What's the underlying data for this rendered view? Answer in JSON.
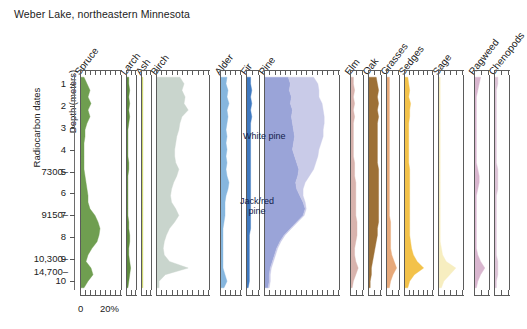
{
  "title": "Weber Lake, northeastern Minnesota",
  "axes": {
    "depth_axis_label": "Depth (meters)",
    "depth_ticks": [
      "1",
      "2",
      "3",
      "4",
      "5",
      "6",
      "7",
      "8",
      "9",
      "10"
    ],
    "radiocarbon_axis_label": "Radiocarbon dates",
    "x_axis_labels": {
      "zero": "0",
      "twenty": "20%"
    }
  },
  "radiocarbon_dates": [
    {
      "label": "7300–",
      "depth": 5.0
    },
    {
      "label": "9150–",
      "depth": 7.0
    },
    {
      "label": "10,300–",
      "depth": 9.0
    },
    {
      "label": "14,700–",
      "depth": 9.6
    }
  ],
  "annotations": [
    {
      "name": "white-pine-label",
      "text": "White pine",
      "x": 243,
      "y": 131
    },
    {
      "name": "jack-red-pine-label",
      "text": "Jack/red\npine",
      "x": 240,
      "y": 196
    }
  ],
  "colors": {
    "spruce": "#6f9e50",
    "larch": "#5d8a3e",
    "ash": "#cdd66a",
    "birch": "#c9d5cd",
    "alder": "#86b6de",
    "fir": "#3f79c0",
    "jack_red_pine": "#9aa4d8",
    "white_pine": "#c9cbe8",
    "elm": "#d8b3ad",
    "oak": "#9d7036",
    "grasses": "#e7a97a",
    "sedges": "#f3c24a",
    "sage": "#f7eec0",
    "ragweed": "#d9b6cf",
    "chenopods": "#dcc3d6",
    "frame": "#5b5b5b"
  },
  "chart_data": {
    "type": "area",
    "orientation": "vertical-stratigraphic",
    "title": "Weber Lake, northeastern Minnesota",
    "xlabel": "Pollen percentage",
    "ylabel": "Depth (meters)",
    "ylim": [
      0.6,
      10.4
    ],
    "xlim": [
      0,
      40
    ],
    "x_tick_interval": 5,
    "grid": false,
    "legend": "in-panel annotations",
    "depths": [
      0.7,
      1.0,
      1.3,
      1.6,
      1.9,
      2.2,
      2.5,
      2.8,
      3.1,
      3.4,
      3.7,
      4.0,
      4.3,
      4.6,
      4.9,
      5.2,
      5.5,
      5.8,
      6.1,
      6.4,
      6.7,
      7.0,
      7.3,
      7.6,
      7.9,
      8.2,
      8.5,
      8.8,
      9.1,
      9.4,
      9.7,
      10.0,
      10.3
    ],
    "panels": [
      {
        "name": "spruce",
        "label": "Spruce",
        "width_units": 42,
        "max_percent": 40,
        "series": [
          {
            "name": "Spruce",
            "color": "#6f9e50",
            "values": [
              3,
              6,
              9,
              7,
              10,
              7,
              9,
              6,
              4,
              4,
              3,
              3,
              3,
              3,
              3,
              4,
              5,
              6,
              7,
              7,
              9,
              14,
              17,
              19,
              18,
              16,
              11,
              7,
              5,
              10,
              12,
              7,
              3
            ]
          }
        ]
      },
      {
        "name": "larch",
        "label": "Larch",
        "width_units": 11,
        "max_percent": 10,
        "series": [
          {
            "name": "Larch",
            "color": "#5d8a3e",
            "values": [
              2,
              2,
              3,
              2,
              3,
              2,
              3,
              2,
              1,
              1,
              1,
              1,
              1,
              2,
              2,
              1,
              1,
              1,
              1,
              1,
              1,
              1,
              2,
              2,
              3,
              3,
              2,
              2,
              3,
              4,
              3,
              2,
              1
            ]
          }
        ]
      },
      {
        "name": "ash",
        "label": "Ash",
        "width_units": 11,
        "max_percent": 10,
        "series": [
          {
            "name": "Ash",
            "color": "#cdd66a",
            "values": [
              1,
              1,
              1,
              1,
              1,
              1,
              1,
              1,
              1,
              1,
              1,
              1,
              1,
              1,
              1,
              1,
              1,
              1,
              1,
              1,
              1,
              1,
              1,
              1,
              1,
              1,
              1,
              1,
              1,
              1,
              1,
              1,
              1
            ]
          }
        ]
      },
      {
        "name": "birch",
        "label": "Birch",
        "width_units": 54,
        "max_percent": 50,
        "series": [
          {
            "name": "Birch",
            "color": "#c9d5cd",
            "values": [
              22,
              26,
              24,
              27,
              26,
              30,
              24,
              22,
              21,
              19,
              18,
              17,
              17,
              18,
              21,
              19,
              16,
              14,
              13,
              14,
              18,
              21,
              17,
              12,
              9,
              7,
              6,
              7,
              12,
              30,
              8,
              2,
              2
            ]
          }
        ]
      },
      {
        "name": "alder",
        "label": "Alder",
        "width_units": 22,
        "max_percent": 20,
        "series": [
          {
            "name": "Alder",
            "color": "#86b6de",
            "values": [
              6,
              5,
              7,
              6,
              8,
              6,
              7,
              6,
              5,
              6,
              5,
              6,
              5,
              6,
              5,
              6,
              8,
              7,
              5,
              4,
              4,
              4,
              3,
              2,
              2,
              2,
              2,
              2,
              2,
              2,
              4,
              6,
              3
            ]
          }
        ]
      },
      {
        "name": "fir",
        "label": "Fir",
        "width_units": 14,
        "max_percent": 10,
        "series": [
          {
            "name": "Fir",
            "color": "#3f79c0",
            "values": [
              3,
              3,
              4,
              3,
              4,
              3,
              4,
              3,
              3,
              3,
              3,
              3,
              3,
              3,
              3,
              3,
              3,
              3,
              3,
              3,
              3,
              3,
              3,
              3,
              2,
              2,
              2,
              2,
              2,
              2,
              2,
              2,
              1
            ]
          }
        ]
      },
      {
        "name": "pine",
        "label": "Pine",
        "width_units": 76,
        "max_percent": 70,
        "stacked": true,
        "series": [
          {
            "name": "Jack/red pine",
            "color": "#9aa4d8",
            "values": [
              22,
              24,
              23,
              25,
              24,
              26,
              25,
              26,
              27,
              28,
              27,
              26,
              28,
              30,
              32,
              31,
              29,
              30,
              33,
              36,
              38,
              36,
              30,
              24,
              18,
              14,
              11,
              9,
              7,
              5,
              4,
              4,
              3
            ]
          },
          {
            "name": "White pine",
            "color": "#c9cbe8",
            "values": [
              24,
              26,
              28,
              26,
              30,
              29,
              31,
              30,
              28,
              27,
              26,
              25,
              22,
              18,
              14,
              11,
              9,
              6,
              3,
              2,
              1,
              1,
              1,
              1,
              1,
              1,
              1,
              1,
              1,
              1,
              1,
              1,
              1
            ]
          }
        ]
      },
      {
        "name": "elm",
        "label": "Elm",
        "width_units": 14,
        "max_percent": 10,
        "series": [
          {
            "name": "Elm",
            "color": "#d8b3ad",
            "values": [
              2,
              2,
              3,
              2,
              3,
              2,
              3,
              2,
              2,
              2,
              2,
              2,
              2,
              3,
              3,
              3,
              4,
              4,
              4,
              4,
              4,
              4,
              5,
              5,
              5,
              4,
              3,
              3,
              4,
              6,
              4,
              2,
              1
            ]
          }
        ]
      },
      {
        "name": "oak",
        "label": "Oak",
        "width_units": 14,
        "max_percent": 10,
        "series": [
          {
            "name": "Oak",
            "color": "#9d7036",
            "values": [
              6,
              7,
              8,
              7,
              8,
              7,
              8,
              7,
              7,
              7,
              7,
              7,
              7,
              7,
              8,
              8,
              8,
              8,
              8,
              8,
              8,
              8,
              8,
              7,
              7,
              6,
              5,
              4,
              3,
              2,
              2,
              1,
              1
            ]
          }
        ]
      },
      {
        "name": "grasses",
        "label": "Grasses",
        "width_units": 14,
        "max_percent": 10,
        "series": [
          {
            "name": "Grasses",
            "color": "#e7a97a",
            "values": [
              2,
              2,
              2,
              2,
              2,
              2,
              2,
              2,
              2,
              2,
              2,
              2,
              2,
              2,
              2,
              2,
              2,
              2,
              2,
              2,
              2,
              2,
              3,
              3,
              3,
              3,
              3,
              4,
              6,
              8,
              5,
              3,
              2
            ]
          }
        ]
      },
      {
        "name": "sedges",
        "label": "Sedges",
        "width_units": 30,
        "max_percent": 30,
        "series": [
          {
            "name": "Sedges",
            "color": "#f3c24a",
            "values": [
              3,
              4,
              5,
              4,
              6,
              5,
              5,
              4,
              4,
              4,
              4,
              4,
              4,
              4,
              5,
              5,
              5,
              5,
              5,
              5,
              5,
              5,
              5,
              5,
              5,
              6,
              7,
              9,
              13,
              20,
              10,
              5,
              3
            ]
          }
        ]
      },
      {
        "name": "sage",
        "label": "Sage",
        "width_units": 26,
        "max_percent": 20,
        "series": [
          {
            "name": "Sage",
            "color": "#f7eec0",
            "values": [
              1,
              1,
              1,
              1,
              1,
              1,
              1,
              1,
              1,
              1,
              1,
              1,
              1,
              1,
              1,
              1,
              1,
              1,
              1,
              1,
              1,
              1,
              1,
              1,
              1,
              1,
              2,
              3,
              6,
              14,
              9,
              4,
              2
            ]
          }
        ]
      },
      {
        "name": "ragweed",
        "label": "Ragweed",
        "width_units": 16,
        "max_percent": 10,
        "series": [
          {
            "name": "Ragweed",
            "color": "#d9b6cf",
            "values": [
              4,
              3,
              2,
              1,
              1,
              1,
              1,
              1,
              1,
              1,
              1,
              1,
              1,
              1,
              2,
              3,
              3,
              2,
              1,
              1,
              1,
              1,
              1,
              1,
              1,
              1,
              1,
              2,
              4,
              7,
              4,
              2,
              1
            ]
          }
        ]
      },
      {
        "name": "chenopods",
        "label": "Chenopods",
        "width_units": 16,
        "max_percent": 10,
        "series": [
          {
            "name": "Chenopods",
            "color": "#dcc3d6",
            "values": [
              2,
              2,
              1,
              1,
              1,
              1,
              1,
              1,
              1,
              1,
              1,
              1,
              1,
              1,
              2,
              2,
              2,
              2,
              1,
              1,
              1,
              1,
              1,
              1,
              1,
              1,
              1,
              1,
              2,
              2,
              2,
              1,
              1
            ]
          }
        ]
      }
    ]
  }
}
